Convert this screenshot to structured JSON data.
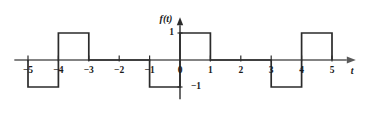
{
  "figure": {
    "type": "square-wave-plot",
    "background_color": "#ffffff",
    "axis_color": "#5a5a5a",
    "curve_color": "#2b2b2b",
    "text_color": "#1a1a1a"
  },
  "axes": {
    "y_axis_label": "f(t)",
    "x_axis_label": "t",
    "x_ticks": [
      {
        "value": -5,
        "label": "−5"
      },
      {
        "value": -4,
        "label": "−4"
      },
      {
        "value": -3,
        "label": "−3"
      },
      {
        "value": -2,
        "label": "−2"
      },
      {
        "value": -1,
        "label": "−1"
      },
      {
        "value": 0,
        "label": "0"
      },
      {
        "value": 1,
        "label": "1"
      },
      {
        "value": 2,
        "label": "2"
      },
      {
        "value": 3,
        "label": "3"
      },
      {
        "value": 4,
        "label": "4"
      },
      {
        "value": 5,
        "label": "5"
      }
    ],
    "y_ticks": [
      {
        "value": 1,
        "label": "1"
      },
      {
        "value": -1,
        "label": "−1"
      }
    ],
    "xlim": [
      -5.45,
      5.75
    ],
    "ylim": [
      -1.45,
      1.55
    ]
  },
  "chart_data": {
    "type": "line",
    "title": "",
    "xlabel": "t",
    "ylabel": "f(t)",
    "xlim": [
      -5.45,
      5.75
    ],
    "ylim": [
      -1.45,
      1.55
    ],
    "grid": false,
    "legend": null,
    "x_tick_labels": [
      "−5",
      "−4",
      "−3",
      "−2",
      "−1",
      "0",
      "1",
      "2",
      "3",
      "4",
      "5"
    ],
    "x_tick_values": [
      -5,
      -4,
      -3,
      -2,
      -1,
      0,
      1,
      2,
      3,
      4,
      5
    ],
    "y_tick_labels": [
      "1",
      "−1"
    ],
    "y_tick_values": [
      1,
      -1
    ],
    "period": 4,
    "amplitude": 1,
    "segments": [
      {
        "from": -5,
        "to": -4,
        "value": -1
      },
      {
        "from": -4,
        "to": -3,
        "value": 1
      },
      {
        "from": -3,
        "to": -1,
        "value": 0
      },
      {
        "from": -1,
        "to": 0,
        "value": -1
      },
      {
        "from": 0,
        "to": 1,
        "value": 1
      },
      {
        "from": 1,
        "to": 3,
        "value": 0
      },
      {
        "from": 3,
        "to": 4,
        "value": -1
      },
      {
        "from": 4,
        "to": 5,
        "value": 1
      }
    ],
    "x": [
      -5,
      -5,
      -4,
      -4,
      -3,
      -3,
      -1,
      -1,
      0,
      0,
      1,
      1,
      3,
      3,
      4,
      4,
      5,
      5
    ],
    "y": [
      0,
      -1,
      -1,
      1,
      1,
      0,
      0,
      -1,
      -1,
      1,
      1,
      0,
      0,
      -1,
      -1,
      1,
      1,
      0
    ]
  }
}
